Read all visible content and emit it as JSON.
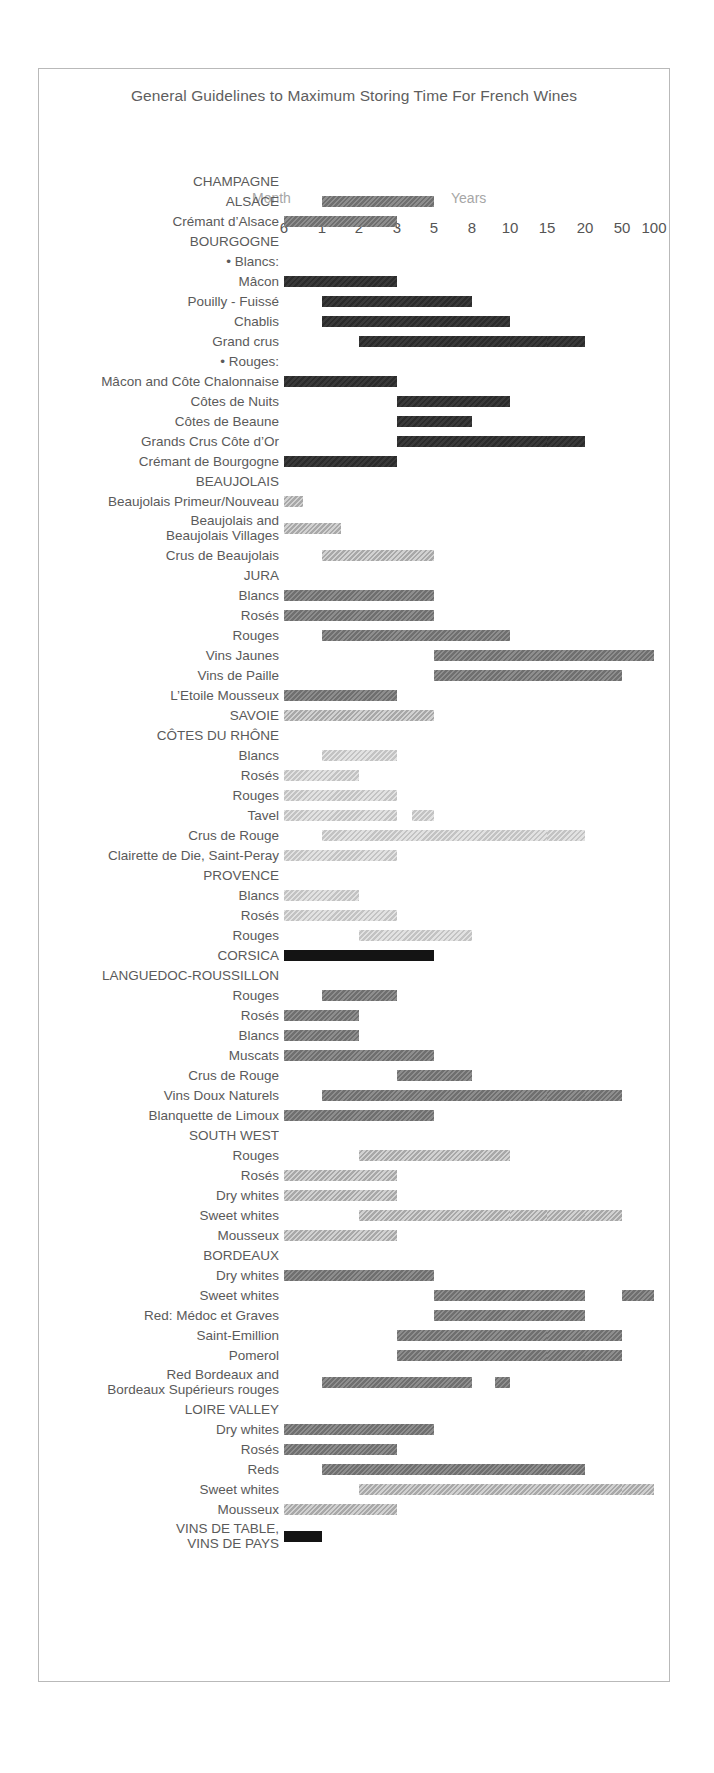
{
  "title": "General Guidelines to Maximum Storing Time For French Wines",
  "header": {
    "month_label": "Month",
    "years_label": "Years"
  },
  "chart_data": {
    "type": "bar",
    "orientation": "horizontal-gantt",
    "title": "General Guidelines to Maximum Storing Time For French Wines",
    "xlabel": "Storing time",
    "ylabel": "Wine",
    "axis_groups": [
      {
        "label": "Month",
        "ticks": [
          "6"
        ]
      },
      {
        "label": "Years",
        "ticks": [
          "1",
          "2",
          "3",
          "5",
          "8",
          "10",
          "15",
          "20",
          "50",
          "100"
        ]
      }
    ],
    "tick_labels": [
      "6",
      "1",
      "2",
      "3",
      "5",
      "8",
      "10",
      "15",
      "20",
      "50",
      "100"
    ],
    "tick_positions_px": [
      283,
      321,
      358,
      396,
      433,
      471,
      509,
      546,
      584,
      621,
      653
    ],
    "grid": true,
    "legend": null,
    "shade_levels": {
      "black": "#141414",
      "dark": "#2f2f2f",
      "mid": "#7e7e7e",
      "light": "#b5b5b5",
      "pale": "#cfcfcf"
    },
    "rows": [
      {
        "label": "CHAMPAGNE",
        "type": "heading",
        "segments": []
      },
      {
        "label": "ALSACE",
        "type": "heading",
        "segments": [
          {
            "from": "1",
            "to": "5",
            "shade": "mid"
          }
        ]
      },
      {
        "label": "Crémant d’Alsace",
        "type": "item",
        "segments": [
          {
            "from": "6",
            "to": "3",
            "shade": "mid"
          }
        ]
      },
      {
        "label": "BOURGOGNE",
        "type": "heading",
        "segments": []
      },
      {
        "label": "• Blancs:",
        "type": "subheading",
        "segments": []
      },
      {
        "label": "Mâcon",
        "type": "item",
        "segments": [
          {
            "from": "6",
            "to": "3",
            "shade": "dark"
          }
        ]
      },
      {
        "label": "Pouilly - Fuissé",
        "type": "item",
        "segments": [
          {
            "from": "1",
            "to": "8",
            "shade": "dark"
          }
        ]
      },
      {
        "label": "Chablis",
        "type": "item",
        "segments": [
          {
            "from": "1",
            "to": "10",
            "shade": "dark"
          }
        ]
      },
      {
        "label": "Grand crus",
        "type": "item",
        "segments": [
          {
            "from": "2",
            "to": "10",
            "shade": "dark"
          },
          {
            "from": "10",
            "to": "15",
            "shade": "dark",
            "dash": true
          },
          {
            "from": "15",
            "to": "20",
            "shade": "dark",
            "dash": true
          }
        ]
      },
      {
        "label": "• Rouges:",
        "type": "subheading",
        "segments": []
      },
      {
        "label": "Mâcon and Côte Chalonnaise",
        "type": "item",
        "segments": [
          {
            "from": "6",
            "to": "3",
            "shade": "dark"
          }
        ]
      },
      {
        "label": "Côtes de Nuits",
        "type": "item",
        "segments": [
          {
            "from": "3",
            "to": "10",
            "shade": "dark"
          }
        ]
      },
      {
        "label": "Côtes de Beaune",
        "type": "item",
        "segments": [
          {
            "from": "3",
            "to": "8",
            "shade": "dark"
          }
        ]
      },
      {
        "label": "Grands Crus Côte d’Or",
        "type": "item",
        "segments": [
          {
            "from": "3",
            "to": "10",
            "shade": "dark"
          },
          {
            "from": "10",
            "to": "15",
            "shade": "dark",
            "dash": true
          },
          {
            "from": "15",
            "to": "20",
            "shade": "dark",
            "dash": true
          }
        ]
      },
      {
        "label": "Crémant de Bourgogne",
        "type": "item",
        "segments": [
          {
            "from": "6",
            "to": "3",
            "shade": "dark"
          }
        ]
      },
      {
        "label": "BEAUJOLAIS",
        "type": "heading",
        "segments": []
      },
      {
        "label": "Beaujolais Primeur/Nouveau",
        "type": "item",
        "segments": [
          {
            "from": "6",
            "to": "0.5",
            "shade": "light"
          }
        ]
      },
      {
        "label": "Beaujolais and\nBeaujolais Villages",
        "type": "item2",
        "segments": [
          {
            "from": "6",
            "to": "1.5",
            "shade": "light"
          }
        ]
      },
      {
        "label": "Crus de Beaujolais",
        "type": "item",
        "segments": [
          {
            "from": "1",
            "to": "5",
            "shade": "light"
          }
        ]
      },
      {
        "label": "JURA",
        "type": "heading",
        "segments": []
      },
      {
        "label": "Blancs",
        "type": "item",
        "segments": [
          {
            "from": "6",
            "to": "5",
            "shade": "mid"
          }
        ]
      },
      {
        "label": "Rosés",
        "type": "item",
        "segments": [
          {
            "from": "6",
            "to": "5",
            "shade": "mid"
          }
        ]
      },
      {
        "label": "Rouges",
        "type": "item",
        "segments": [
          {
            "from": "1",
            "to": "10",
            "shade": "mid"
          }
        ]
      },
      {
        "label": "Vins Jaunes",
        "type": "item",
        "segments": [
          {
            "from": "5",
            "to": "100",
            "shade": "mid"
          }
        ]
      },
      {
        "label": "Vins de Paille",
        "type": "item",
        "segments": [
          {
            "from": "5",
            "to": "50",
            "shade": "mid"
          }
        ]
      },
      {
        "label": "L’Etoile Mousseux",
        "type": "item",
        "segments": [
          {
            "from": "6",
            "to": "3",
            "shade": "mid"
          }
        ]
      },
      {
        "label": "SAVOIE",
        "type": "heading",
        "segments": [
          {
            "from": "6",
            "to": "5",
            "shade": "light"
          }
        ]
      },
      {
        "label": "CÔTES DU RHÔNE",
        "type": "heading",
        "segments": []
      },
      {
        "label": "Blancs",
        "type": "item",
        "segments": [
          {
            "from": "1",
            "to": "3",
            "shade": "pale"
          }
        ]
      },
      {
        "label": "Rosés",
        "type": "item",
        "segments": [
          {
            "from": "6",
            "to": "2",
            "shade": "pale"
          }
        ]
      },
      {
        "label": "Rouges",
        "type": "item",
        "segments": [
          {
            "from": "6",
            "to": "3",
            "shade": "pale"
          }
        ]
      },
      {
        "label": "Tavel",
        "type": "item",
        "segments": [
          {
            "from": "6",
            "to": "3",
            "shade": "pale"
          },
          {
            "from": "3.4",
            "to": "5",
            "shade": "pale",
            "dash": true
          }
        ]
      },
      {
        "label": "Crus de Rouge",
        "type": "item",
        "segments": [
          {
            "from": "1",
            "to": "10",
            "shade": "pale"
          },
          {
            "from": "10",
            "to": "15",
            "shade": "pale",
            "dash": true
          },
          {
            "from": "15",
            "to": "20",
            "shade": "pale",
            "dash": true
          }
        ]
      },
      {
        "label": "Clairette de Die, Saint-Peray",
        "type": "item",
        "segments": [
          {
            "from": "6",
            "to": "3",
            "shade": "pale"
          }
        ]
      },
      {
        "label": "PROVENCE",
        "type": "heading",
        "segments": []
      },
      {
        "label": "Blancs",
        "type": "item",
        "segments": [
          {
            "from": "6",
            "to": "2",
            "shade": "pale"
          }
        ]
      },
      {
        "label": "Rosés",
        "type": "item",
        "segments": [
          {
            "from": "6",
            "to": "3",
            "shade": "pale"
          }
        ]
      },
      {
        "label": "Rouges",
        "type": "item",
        "segments": [
          {
            "from": "2",
            "to": "8",
            "shade": "pale"
          }
        ]
      },
      {
        "label": "CORSICA",
        "type": "heading",
        "segments": [
          {
            "from": "6",
            "to": "5",
            "shade": "black"
          }
        ]
      },
      {
        "label": "LANGUEDOC-ROUSSILLON",
        "type": "heading",
        "segments": []
      },
      {
        "label": "Rouges",
        "type": "item",
        "segments": [
          {
            "from": "1",
            "to": "3",
            "shade": "mid"
          }
        ]
      },
      {
        "label": "Rosés",
        "type": "item",
        "segments": [
          {
            "from": "6",
            "to": "2",
            "shade": "mid"
          }
        ]
      },
      {
        "label": "Blancs",
        "type": "item",
        "segments": [
          {
            "from": "6",
            "to": "2",
            "shade": "mid"
          }
        ]
      },
      {
        "label": "Muscats",
        "type": "item",
        "segments": [
          {
            "from": "6",
            "to": "5",
            "shade": "mid"
          }
        ]
      },
      {
        "label": "Crus de Rouge",
        "type": "item",
        "segments": [
          {
            "from": "3",
            "to": "8",
            "shade": "mid"
          }
        ]
      },
      {
        "label": "Vins Doux Naturels",
        "type": "item",
        "segments": [
          {
            "from": "1",
            "to": "15",
            "shade": "mid"
          },
          {
            "from": "15",
            "to": "20",
            "shade": "mid",
            "dash": true
          },
          {
            "from": "20",
            "to": "50",
            "shade": "mid",
            "dash": true
          }
        ]
      },
      {
        "label": "Blanquette de Limoux",
        "type": "item",
        "segments": [
          {
            "from": "6",
            "to": "5",
            "shade": "mid"
          }
        ]
      },
      {
        "label": "SOUTH WEST",
        "type": "heading",
        "segments": []
      },
      {
        "label": "Rouges",
        "type": "item",
        "segments": [
          {
            "from": "2",
            "to": "10",
            "shade": "light"
          }
        ]
      },
      {
        "label": "Rosés",
        "type": "item",
        "segments": [
          {
            "from": "6",
            "to": "3",
            "shade": "light"
          }
        ]
      },
      {
        "label": "Dry whites",
        "type": "item",
        "segments": [
          {
            "from": "6",
            "to": "3",
            "shade": "light"
          }
        ]
      },
      {
        "label": "Sweet whites",
        "type": "item",
        "segments": [
          {
            "from": "2",
            "to": "10",
            "shade": "light"
          },
          {
            "from": "10",
            "to": "15",
            "shade": "light",
            "dash": true
          },
          {
            "from": "15",
            "to": "20",
            "shade": "light",
            "dash": true
          },
          {
            "from": "20",
            "to": "50",
            "shade": "light",
            "dash": true
          }
        ]
      },
      {
        "label": "Mousseux",
        "type": "item",
        "segments": [
          {
            "from": "6",
            "to": "3",
            "shade": "light"
          }
        ]
      },
      {
        "label": "BORDEAUX",
        "type": "heading",
        "segments": []
      },
      {
        "label": "Dry whites",
        "type": "item",
        "segments": [
          {
            "from": "6",
            "to": "5",
            "shade": "mid"
          }
        ]
      },
      {
        "label": "Sweet whites",
        "type": "item",
        "segments": [
          {
            "from": "5",
            "to": "20",
            "shade": "mid"
          },
          {
            "from": "50",
            "to": "100",
            "shade": "mid",
            "dash": true
          }
        ]
      },
      {
        "label": "Red: Médoc et Graves",
        "type": "item",
        "segments": [
          {
            "from": "5",
            "to": "20",
            "shade": "mid"
          }
        ]
      },
      {
        "label": "Saint-Emillion",
        "type": "item",
        "segments": [
          {
            "from": "3",
            "to": "15",
            "shade": "mid"
          },
          {
            "from": "15",
            "to": "20",
            "shade": "mid",
            "dash": true
          },
          {
            "from": "20",
            "to": "50",
            "shade": "mid",
            "dash": true
          }
        ]
      },
      {
        "label": "Pomerol",
        "type": "item",
        "segments": [
          {
            "from": "3",
            "to": "15",
            "shade": "mid"
          },
          {
            "from": "15",
            "to": "20",
            "shade": "mid",
            "dash": true
          },
          {
            "from": "20",
            "to": "50",
            "shade": "mid",
            "dash": true
          }
        ]
      },
      {
        "label": "Red Bordeaux and\nBordeaux Supérieurs rouges",
        "type": "item2",
        "segments": [
          {
            "from": "1",
            "to": "8",
            "shade": "mid"
          },
          {
            "from": "8.6",
            "to": "10",
            "shade": "mid",
            "dash": true
          }
        ]
      },
      {
        "label": "LOIRE VALLEY",
        "type": "heading",
        "segments": []
      },
      {
        "label": "Dry whites",
        "type": "item",
        "segments": [
          {
            "from": "6",
            "to": "5",
            "shade": "mid"
          }
        ]
      },
      {
        "label": "Rosés",
        "type": "item",
        "segments": [
          {
            "from": "6",
            "to": "3",
            "shade": "mid"
          }
        ]
      },
      {
        "label": "Reds",
        "type": "item",
        "segments": [
          {
            "from": "1",
            "to": "10",
            "shade": "mid"
          },
          {
            "from": "10",
            "to": "15",
            "shade": "mid",
            "dash": true
          },
          {
            "from": "15",
            "to": "20",
            "shade": "mid",
            "dash": true
          }
        ]
      },
      {
        "label": "Sweet whites",
        "type": "item",
        "segments": [
          {
            "from": "2",
            "to": "20",
            "shade": "light"
          },
          {
            "from": "20",
            "to": "50",
            "shade": "light",
            "dash": true
          },
          {
            "from": "50",
            "to": "100",
            "shade": "light",
            "dash": true
          }
        ]
      },
      {
        "label": "Mousseux",
        "type": "item",
        "segments": [
          {
            "from": "6",
            "to": "3",
            "shade": "light"
          }
        ]
      },
      {
        "label": "VINS DE TABLE,\nVINS DE PAYS",
        "type": "heading2",
        "segments": [
          {
            "from": "6",
            "to": "1",
            "shade": "black"
          }
        ]
      }
    ]
  }
}
